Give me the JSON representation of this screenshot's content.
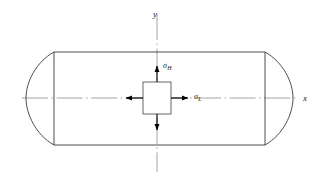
{
  "figure": {
    "background_color": "#ffffff",
    "line_color": "#3a3a3a",
    "axis_color": "#9a9a9a",
    "arrow_color": "#000000",
    "text_color": "#1a1a1a"
  },
  "axes": {
    "x_label": "x",
    "y_label": "y",
    "origin_x": 157,
    "origin_y": 98
  },
  "vessel": {
    "name": "cylindrical-pressure-vessel",
    "body_left": 54,
    "body_right": 265,
    "body_top": 52,
    "body_bottom": 145,
    "cap_bulge": 30
  },
  "stress_element": {
    "name": "stress-element-square",
    "left": 143,
    "right": 171,
    "top": 82,
    "bottom": 114
  },
  "stresses": [
    {
      "id": "hoop",
      "symbol": "σ",
      "subscript": "H",
      "direction": "up",
      "label_x": 163,
      "label_y": 68
    },
    {
      "id": "longitudinal",
      "symbol": "σ",
      "subscript": "L",
      "direction": "right",
      "label_x": 194,
      "label_y": 99
    }
  ],
  "arrows": [
    {
      "name": "hoop-stress-arrow-up",
      "direction": "up"
    },
    {
      "name": "hoop-stress-arrow-down",
      "direction": "down"
    },
    {
      "name": "longitudinal-stress-arrow-right",
      "direction": "right"
    },
    {
      "name": "longitudinal-stress-arrow-left",
      "direction": "left"
    }
  ]
}
